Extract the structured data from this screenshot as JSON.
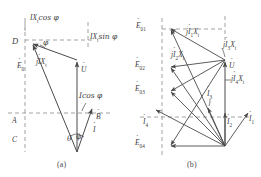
{
  "figure": {
    "kind": "phasor-diagram-pair",
    "stroke_color": "#4a4a4a",
    "dash_color": "#8c8c8c",
    "text_color": "#3c3c3c",
    "background": "#ffffff"
  },
  "panel_a": {
    "caption": "(a)",
    "axis_labels": {
      "a": "A",
      "b": "B",
      "c": "C",
      "d": "D"
    },
    "labels": {
      "ix_cos": "IX",
      "ix_cos_sub": "t",
      "ix_cos_tail": "cos φ",
      "ix_sin": "IX",
      "ix_sin_sub": "t",
      "ix_sin_tail": "sin φ",
      "e0": "E",
      "e0_sub": "0",
      "jix": "j",
      "jix_i": "I",
      "jix_x": "X",
      "jix_sub": "t",
      "u": "U",
      "i_cos": "Icos φ",
      "i": "I",
      "phi_top": "φ",
      "phi_bottom": "φ",
      "theta": "θ"
    }
  },
  "panel_b": {
    "caption": "(b)",
    "labels": {
      "e01": "E",
      "e01_sub": "01",
      "e02": "E",
      "e02_sub": "02",
      "e03": "E",
      "e03_sub": "03",
      "e04": "E",
      "e04_sub": "04",
      "ji1x": "j",
      "ji1x_i": "I",
      "ji1x_isub": "1",
      "ji1x_x": "X",
      "ji1x_xsub": "t",
      "ji2x": "j",
      "ji2x_i": "I",
      "ji2x_isub": "2",
      "ji2x_x": "X",
      "ji2x_xsub": "t",
      "ji3x": "j",
      "ji3x_i": "I",
      "ji3x_isub": "3",
      "ji3x_x": "X",
      "ji3x_xsub": "t",
      "ji4x": "j",
      "ji4x_i": "I",
      "ji4x_isub": "4",
      "ji4x_x": "X",
      "ji4x_xsub": "t",
      "u": "U",
      "i1": "I",
      "i1_sub": "1",
      "i2": "I",
      "i2_sub": "2",
      "i3": "I",
      "i3_sub": "3",
      "i4": "I",
      "i4_sub": "4"
    }
  }
}
